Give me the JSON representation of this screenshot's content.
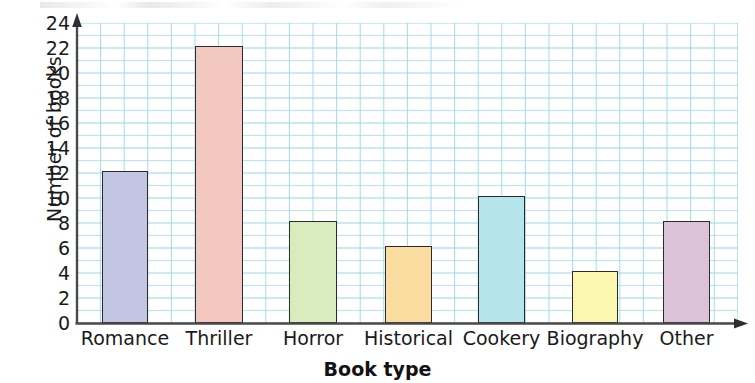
{
  "chart_data": {
    "type": "bar",
    "title": "",
    "subtitle": "",
    "xlabel": "Book type",
    "ylabel": "Number of books",
    "categories": [
      "Romance",
      "Thriller",
      "Horror",
      "Historical",
      "Cookery",
      "Biography",
      "Other"
    ],
    "values": [
      12,
      22,
      8,
      6,
      10,
      4,
      8
    ],
    "ylim": [
      0,
      24
    ],
    "y_tick_step": 2,
    "y_ticks": [
      0,
      2,
      4,
      6,
      8,
      10,
      12,
      14,
      16,
      18,
      20,
      22,
      24
    ],
    "y_tick_labels": [
      "0",
      "2",
      "4",
      "6",
      "8",
      "10",
      "12",
      "14",
      "16",
      "18",
      "20",
      "22",
      "24"
    ],
    "grid": true,
    "grid_color": "#8fd7ea",
    "grid_minor_per_major": 1,
    "legend": "none",
    "axis_color": "#4a4a4a",
    "bar_edge_color": "#2e2a2b",
    "background_color": "#ffffff",
    "bar_colors": [
      "#c2c6e4",
      "#f3c9bf",
      "#d8ecbe",
      "#fbdca0",
      "#b5e4ec",
      "#fbf7b0",
      "#dcc2d8"
    ],
    "bars": [
      {
        "category": "Romance",
        "value": 12,
        "color": "#c2c6e4"
      },
      {
        "category": "Thriller",
        "value": 22,
        "color": "#f3c9bf"
      },
      {
        "category": "Horror",
        "value": 8,
        "color": "#d8ecbe"
      },
      {
        "category": "Historical",
        "value": 6,
        "color": "#fbdca0"
      },
      {
        "category": "Cookery",
        "value": 10,
        "color": "#b5e4ec"
      },
      {
        "category": "Biography",
        "value": 4,
        "color": "#fbf7b0"
      },
      {
        "category": "Other",
        "value": 8,
        "color": "#dcc2d8"
      }
    ]
  },
  "layout": {
    "plot_left": 77,
    "plot_top": 23,
    "plot_width": 661,
    "plot_height": 300,
    "bar_geometry": [
      {
        "x": 25,
        "w": 46
      },
      {
        "x": 118,
        "w": 48
      },
      {
        "x": 212,
        "w": 48
      },
      {
        "x": 308,
        "w": 47
      },
      {
        "x": 401,
        "w": 47
      },
      {
        "x": 495,
        "w": 46
      },
      {
        "x": 586,
        "w": 47
      }
    ],
    "minor_grid_step_px": 23.6
  }
}
